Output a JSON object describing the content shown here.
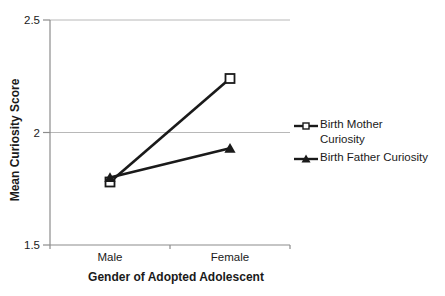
{
  "chart_data": {
    "type": "line",
    "title": "",
    "xlabel": "Gender of Adopted Adolescent",
    "ylabel": "Mean Curiosity Score",
    "categories": [
      "Male",
      "Female"
    ],
    "series": [
      {
        "name": "Birth Mother Curiosity",
        "legend_lines": [
          "Birth Mother",
          "Curiosity"
        ],
        "marker": "open-square",
        "values": [
          1.78,
          2.24
        ]
      },
      {
        "name": "Birth Father Curiosity",
        "legend_lines": [
          "Birth Father Curiosity"
        ],
        "marker": "filled-triangle",
        "values": [
          1.8,
          1.93
        ]
      }
    ],
    "ylim": [
      1.5,
      2.5
    ],
    "yticks": [
      {
        "value": 2.5,
        "label": "2.5"
      },
      {
        "value": 2.0,
        "label": "2"
      },
      {
        "value": 1.5,
        "label": "1.5"
      }
    ],
    "grid": true,
    "legend_position": "right",
    "colors": {
      "background": "#ffffff",
      "grid": "#b8b8b8",
      "axis": "#8c8c8c",
      "series": "#1a1a1a",
      "text": "#1a1a1a",
      "marker_fill_open": "#ffffff"
    }
  }
}
